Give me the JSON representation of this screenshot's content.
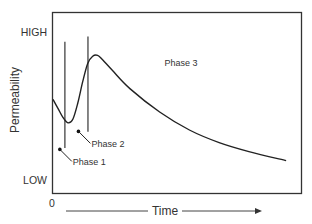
{
  "chart_data": {
    "type": "line",
    "title": "",
    "xlabel": "Time",
    "ylabel": "Permeability",
    "x_origin_label": "0",
    "y_tick_labels": {
      "high": "HIGH",
      "low": "LOW"
    },
    "xlim": [
      0,
      100
    ],
    "ylim": [
      0,
      100
    ],
    "grid": false,
    "series": [
      {
        "name": "Permeability over time",
        "points": [
          [
            0,
            52
          ],
          [
            2,
            47
          ],
          [
            4,
            42
          ],
          [
            6,
            39
          ],
          [
            8,
            41
          ],
          [
            10,
            50
          ],
          [
            12,
            62
          ],
          [
            14,
            72
          ],
          [
            16,
            76
          ],
          [
            18,
            76.5
          ],
          [
            20,
            74
          ],
          [
            24,
            68
          ],
          [
            31,
            58
          ],
          [
            43,
            45
          ],
          [
            55,
            35
          ],
          [
            67,
            28
          ],
          [
            79,
            23
          ],
          [
            94,
            18
          ]
        ]
      }
    ],
    "phase_markers": [
      {
        "name": "Phase 1 boundary",
        "x": 4.8,
        "y_top": 84,
        "y_bottom": 25
      },
      {
        "name": "Phase 2 boundary",
        "x": 14.1,
        "y_top": 87,
        "y_bottom": 34
      }
    ],
    "annotations": [
      {
        "text": "Phase 1",
        "x": 8,
        "y": 17
      },
      {
        "text": "Phase 2",
        "x": 15.5,
        "y": 27
      },
      {
        "text": "Phase 3",
        "x": 45,
        "y": 72
      }
    ]
  }
}
